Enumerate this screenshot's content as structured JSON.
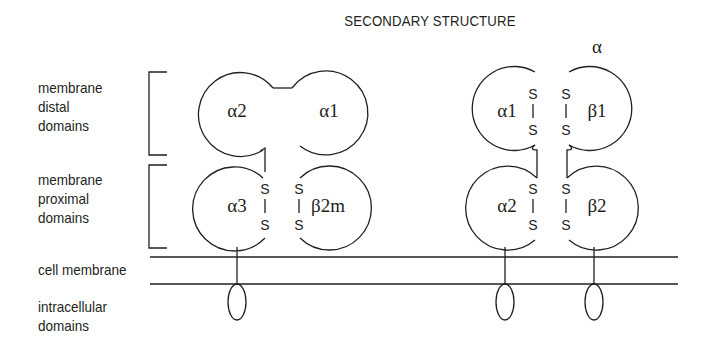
{
  "title": "SECONDARY STRUCTURE",
  "top_label": "α",
  "row_labels": {
    "distal": [
      "membrane",
      "distal",
      "domains"
    ],
    "proximal": [
      "membrane",
      "proximal",
      "domains"
    ],
    "membrane": "cell membrane",
    "intracellular": [
      "intracellular",
      "domains"
    ]
  },
  "class_i": {
    "distal": [
      "α2",
      "α1"
    ],
    "proximal": [
      "α3",
      "β2m"
    ],
    "disulfide": "S"
  },
  "class_ii": {
    "distal": [
      "α1",
      "β1"
    ],
    "proximal": [
      "α2",
      "β2"
    ],
    "disulfide": "S"
  },
  "colors": {
    "line": "#231f20",
    "background": "#ffffff"
  }
}
